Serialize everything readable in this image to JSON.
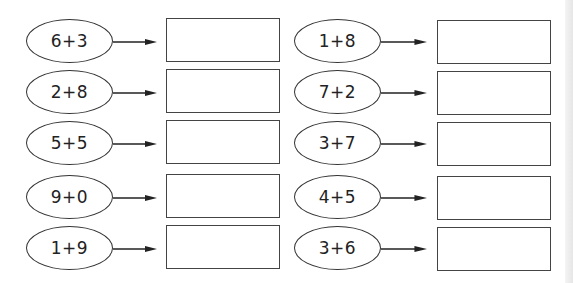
{
  "worksheet": {
    "left_column": [
      {
        "expression": "6+3",
        "answer": ""
      },
      {
        "expression": "2+8",
        "answer": ""
      },
      {
        "expression": "5+5",
        "answer": ""
      },
      {
        "expression": "9+0",
        "answer": ""
      },
      {
        "expression": "1+9",
        "answer": ""
      }
    ],
    "right_column": [
      {
        "expression": "1+8",
        "answer": ""
      },
      {
        "expression": "7+2",
        "answer": ""
      },
      {
        "expression": "3+7",
        "answer": ""
      },
      {
        "expression": "4+5",
        "answer": ""
      },
      {
        "expression": "3+6",
        "answer": ""
      }
    ]
  }
}
